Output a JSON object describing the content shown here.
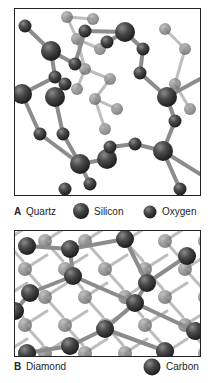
{
  "figure": {
    "panels": [
      {
        "letter": "A",
        "name": "Quartz",
        "legend": [
          {
            "label": "Silicon",
            "atom": "silicon",
            "relative_size": "large"
          },
          {
            "label": "Oxygen",
            "atom": "oxygen",
            "relative_size": "small"
          }
        ]
      },
      {
        "letter": "B",
        "name": "Diamond",
        "legend": [
          {
            "label": "Carbon",
            "atom": "carbon",
            "relative_size": "large"
          }
        ]
      }
    ],
    "colors": {
      "atom_dark": "#3a3a3a",
      "atom_mid": "#6a6a6a",
      "atom_highlight": "#9a9a9a",
      "bond": "#8c8c8c",
      "bond_back": "#bdbdbd",
      "frame_border": "#222222"
    }
  }
}
